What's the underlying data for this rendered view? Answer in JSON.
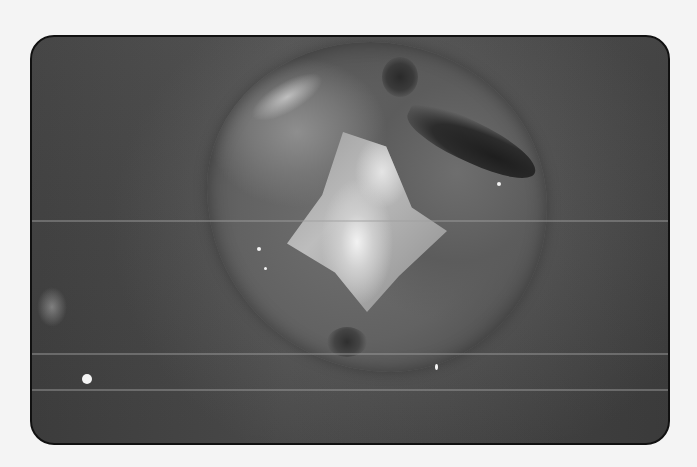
{
  "image": {
    "subject": "occlusal view of a molar tooth with a tooth-colored/metallic filling",
    "style": "grayscale photograph in rounded black-bordered frame",
    "colors": {
      "page_background": "#f4f4f4",
      "frame_border": "#111111",
      "background_tissue": "#4a4a4a",
      "tooth_surface": "#6e6e6e",
      "filling_highlight": "#f2f2f2",
      "dark_fissure": "#1e1e1e"
    }
  }
}
